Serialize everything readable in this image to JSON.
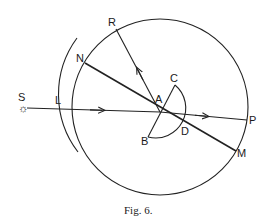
{
  "figure": {
    "caption": "Fig. 6.",
    "labels": {
      "S": "S",
      "L": "L",
      "N": "N",
      "R": "R",
      "A": "A",
      "C": "C",
      "B": "B",
      "D": "D",
      "P": "P",
      "M": "M"
    },
    "source_symbol": "☼",
    "elements": [
      "large circle centered near A",
      "lens arc L outside circle on left",
      "incident ray from S through L to A",
      "transmitted ray from A to P",
      "line NM through A",
      "reflected ray from A to R",
      "semicircle BCD centered on A"
    ]
  }
}
